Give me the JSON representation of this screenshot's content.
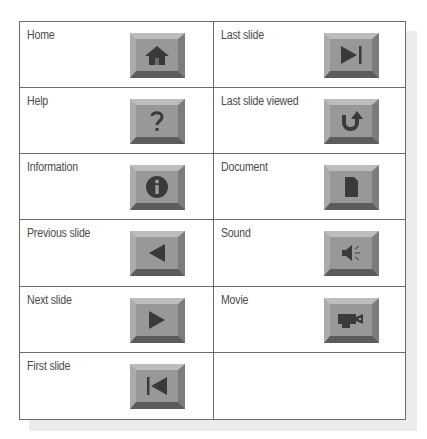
{
  "colors": {
    "table_border": "#6a6a6a",
    "label_text": "#4a4a4a",
    "button_face": "#989898",
    "button_bevel_top": "#bdbdbd",
    "button_bevel_left": "#ababab",
    "button_bevel_right": "#7c7c7c",
    "button_bevel_bottom": "#5c5c5c",
    "icon": "#3a3a3a"
  },
  "table": {
    "rows": [
      {
        "left": {
          "label": "Home",
          "icon": "home-icon"
        },
        "right": {
          "label": "Last slide",
          "icon": "last-slide-icon"
        }
      },
      {
        "left": {
          "label": "Help",
          "icon": "help-icon"
        },
        "right": {
          "label": "Last slide viewed",
          "icon": "return-icon"
        }
      },
      {
        "left": {
          "label": "Information",
          "icon": "info-icon"
        },
        "right": {
          "label": "Document",
          "icon": "document-icon"
        }
      },
      {
        "left": {
          "label": "Previous slide",
          "icon": "previous-icon"
        },
        "right": {
          "label": "Sound",
          "icon": "sound-icon"
        }
      },
      {
        "left": {
          "label": "Next slide",
          "icon": "next-icon"
        },
        "right": {
          "label": "Movie",
          "icon": "movie-icon"
        }
      },
      {
        "left": {
          "label": "First slide",
          "icon": "first-slide-icon"
        },
        "right": {
          "label": "",
          "icon": ""
        }
      }
    ]
  }
}
